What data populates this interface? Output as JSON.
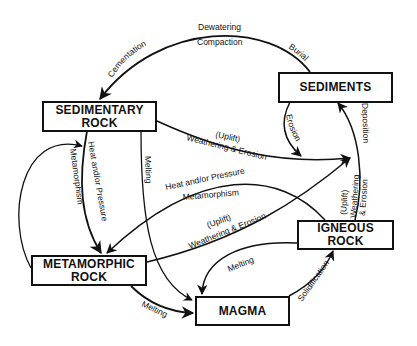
{
  "nodes": {
    "sedimentary": {
      "line1": "SEDIMENTARY",
      "line2": "ROCK"
    },
    "sediments": {
      "line1": "SEDIMENTS"
    },
    "metamorphic": {
      "line1": "METAMORPHIC",
      "line2": "ROCK"
    },
    "igneous": {
      "line1": "IGNEOUS",
      "line2": "ROCK"
    },
    "magma": {
      "line1": "MAGMA"
    }
  },
  "edges": {
    "sediments_to_sedimentary": {
      "top1": "Dewatering",
      "top2": "Compaction",
      "left": "Cementation",
      "right": "Burial"
    },
    "sediments_erosion": {
      "label": "Erosion"
    },
    "sedimentary_weathering": {
      "uplift": "(Uplift)",
      "label": "Weathering & Erosion"
    },
    "sedimentary_to_metamorphic": {
      "label1": "Heat and/or Pressure",
      "label2": "Metamorphism"
    },
    "sedimentary_melting": {
      "label": "Melting"
    },
    "igneous_to_metamorphic": {
      "label1": "Heat and/or Pressure",
      "label2": "Metamorphism"
    },
    "metamorphic_weathering": {
      "uplift": "(Uplift)",
      "label": "Weathering & Erosion"
    },
    "igneous_weathering": {
      "uplift": "(Uplift)",
      "label1": "Weathering",
      "label2": "& Erosion"
    },
    "deposition": {
      "label": "Deposition"
    },
    "igneous_melting": {
      "label": "Melting"
    },
    "metamorphic_melting": {
      "label": "Melting"
    },
    "solidification": {
      "label": "Solidification"
    }
  }
}
